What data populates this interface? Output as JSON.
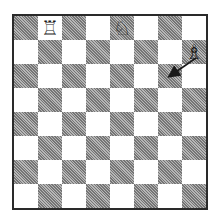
{
  "board": {
    "size": 8,
    "light_color": "#ffffff",
    "dark_color": "#9a9a9a",
    "orientation": "white-bottom",
    "pieces": [
      {
        "square": "b8",
        "piece": "rook",
        "color": "white",
        "glyph": "♖"
      },
      {
        "square": "e8",
        "piece": "knight",
        "color": "white",
        "glyph": "♘"
      },
      {
        "square": "h7",
        "piece": "bishop",
        "color": "white",
        "glyph": "♗"
      }
    ],
    "arrows": [
      {
        "from": "h7",
        "to": "g6",
        "color": "#1a1a1a"
      }
    ]
  }
}
